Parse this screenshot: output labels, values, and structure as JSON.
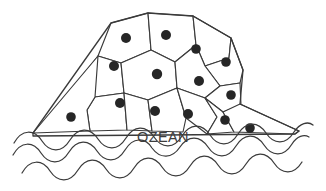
{
  "illustration": {
    "title": "OZEAN",
    "description": "Domed shell divided into polygonal cells with dots, floating on wavy ocean lines",
    "colors": {
      "background": "#ffffff",
      "line": "#3a3a3a",
      "cell_fill": "#ffffff",
      "dot": "#262626",
      "label_text": "#3d3d3d",
      "wave": "#3a3a3a"
    },
    "label": {
      "text": "OZEAN",
      "x": 163,
      "y": 142,
      "font_size": 14.5
    },
    "shell": {
      "outline": "M 33 133 L 111 23 L 148 13 L 193 16 L 231 38 L 243 70 L 240 104 L 299 131 L 295 134 L 33 136 Z",
      "cells": [
        {
          "id": "cell-top-left",
          "points": "111,23 148,13 151,50 121,63 98,56"
        },
        {
          "id": "cell-top-mid",
          "points": "148,13 193,16 196,45 175,62 151,50"
        },
        {
          "id": "cell-top-right",
          "points": "193,16 231,38 229,58 205,66 196,45"
        },
        {
          "id": "cell-upper-right",
          "points": "231,38 243,70 240,83 220,86 205,66 229,58"
        },
        {
          "id": "cell-left-upper",
          "points": "98,56 121,63 124,93 95,97 82,76"
        },
        {
          "id": "cell-center",
          "points": "121,63 151,50 175,62 177,88 148,100 124,93"
        },
        {
          "id": "cell-right-upper",
          "points": "175,62 196,45 205,66 220,86 205,98 177,88"
        },
        {
          "id": "cell-right-edge",
          "points": "220,86 240,83 241,105 223,112 205,98"
        },
        {
          "id": "cell-left-low",
          "points": "95,97 124,93 127,130 90,131 87,110"
        },
        {
          "id": "cell-mid-low",
          "points": "124,93 148,100 152,131 127,130"
        },
        {
          "id": "cell-center-low",
          "points": "148,100 177,88 186,118 183,132 152,131"
        },
        {
          "id": "cell-right-low",
          "points": "177,88 205,98 217,117 207,134 186,118"
        },
        {
          "id": "cell-far-right-low",
          "points": "205,98 223,112 234,132 207,134 217,117"
        },
        {
          "id": "cell-flank-right",
          "points": "223,112 240,104 299,131 295,134 234,132"
        },
        {
          "id": "cell-flank-left",
          "points": "33,133 98,56 95,97 87,110 90,131"
        }
      ],
      "dots": [
        {
          "id": "dot-1",
          "cx": 126,
          "cy": 38,
          "r": 5.0
        },
        {
          "id": "dot-2",
          "cx": 166,
          "cy": 35,
          "r": 5.0
        },
        {
          "id": "dot-3",
          "cx": 196,
          "cy": 49,
          "r": 4.8
        },
        {
          "id": "dot-4",
          "cx": 226,
          "cy": 62,
          "r": 4.8
        },
        {
          "id": "dot-5",
          "cx": 114,
          "cy": 66,
          "r": 5.0
        },
        {
          "id": "dot-6",
          "cx": 157,
          "cy": 74,
          "r": 5.2
        },
        {
          "id": "dot-7",
          "cx": 199,
          "cy": 81,
          "r": 5.0
        },
        {
          "id": "dot-8",
          "cx": 231,
          "cy": 95,
          "r": 4.8
        },
        {
          "id": "dot-9",
          "cx": 120,
          "cy": 103,
          "r": 5.0
        },
        {
          "id": "dot-10",
          "cx": 155,
          "cy": 111,
          "r": 5.0
        },
        {
          "id": "dot-11",
          "cx": 188,
          "cy": 114,
          "r": 5.0
        },
        {
          "id": "dot-12",
          "cx": 225,
          "cy": 120,
          "r": 4.8
        },
        {
          "id": "dot-13",
          "cx": 250,
          "cy": 128,
          "r": 4.8
        },
        {
          "id": "dot-14",
          "cx": 71,
          "cy": 117,
          "r": 4.8
        }
      ]
    },
    "waves": [
      {
        "id": "wave-upper",
        "d": "M 14 143 C 22 129, 34 129, 42 141 C 50 153, 62 153, 70 140 C 78 127, 90 127, 98 139 C 106 151, 118 151, 126 138 C 134 125, 146 125, 154 137 C 162 149, 174 149, 182 136 C 190 123, 202 123, 210 135 C 218 147, 230 147, 238 134 C 246 121, 258 121, 266 133 C 274 145, 286 145, 294 132 C 300 123, 308 121, 313 125"
      },
      {
        "id": "wave-middle",
        "d": "M 13 155 C 21 141, 33 141, 41 153 C 49 165, 61 165, 69 152 C 77 139, 89 139, 97 151 C 105 163, 117 163, 125 150 C 133 137, 145 137, 152 148 C 160 159, 172 159, 180 147 C 188 135, 200 135, 208 147 C 216 159, 228 159, 236 146 C 244 133, 256 133, 264 145 C 272 157, 284 157, 292 144 C 297 136, 304 134, 309 137"
      },
      {
        "id": "wave-lower",
        "d": "M 22 173 C 30 159, 42 159, 50 171 C 58 183, 70 183, 78 170 C 86 157, 98 157, 106 169 C 114 181, 126 181, 134 168 C 142 155, 154 155, 162 167 C 170 179, 182 179, 190 166 C 198 153, 210 153, 218 165 C 226 177, 238 177, 246 164 C 254 151, 266 151, 274 163 C 282 175, 294 175, 302 162"
      }
    ]
  }
}
